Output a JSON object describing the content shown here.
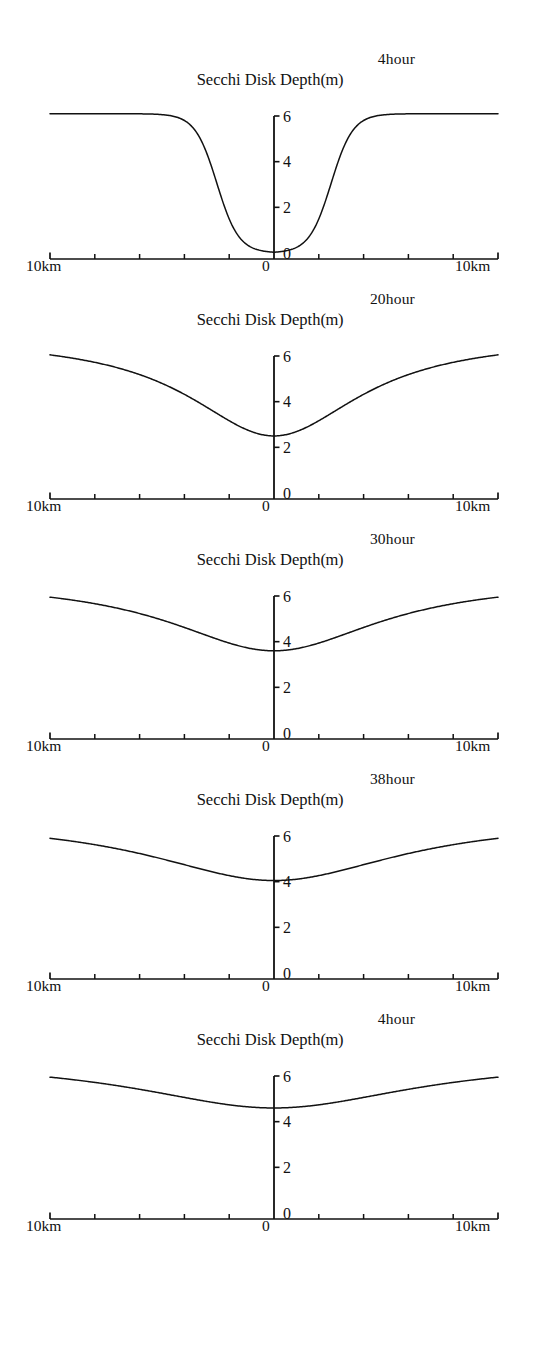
{
  "figure": {
    "axis_title": "Secchi Disk Depth",
    "axis_units": "(m)",
    "x_left_label": "10km",
    "x_center_label": "0",
    "x_right_label": "10km",
    "y_ticks": [
      "0",
      "2",
      "4",
      "6"
    ],
    "caption": ""
  },
  "chart_data": {
    "type": "line",
    "xlabel": "Distance (km)",
    "ylabel": "Secchi Disk Depth (m)",
    "xlim": [
      -10,
      10
    ],
    "ylim": [
      0,
      6.6
    ],
    "x_tick_interval_km": 2,
    "y_tick_values": [
      0,
      2,
      4,
      6
    ],
    "grid": false,
    "legend_position": "none",
    "panel_labels": [
      "4hour",
      "20hour",
      "30hour",
      "38hour",
      "4hour"
    ],
    "x": [
      -10,
      -9,
      -8,
      -7,
      -6,
      -5,
      -4,
      -3,
      -2,
      -1,
      0,
      1,
      2,
      3,
      4,
      5,
      6,
      7,
      8,
      9,
      10
    ],
    "series": [
      {
        "name": "4hour",
        "label": "4hour",
        "minimum_value": 0.0,
        "edge_value": 6.1,
        "values": [
          6.1,
          6.1,
          6.1,
          6.1,
          6.1,
          6.08,
          5.95,
          5.45,
          4.2,
          2.0,
          0.05,
          1.1,
          3.3,
          5.15,
          5.9,
          6.07,
          6.1,
          6.1,
          6.1,
          6.1,
          6.1
        ]
      },
      {
        "name": "20hour",
        "label": "20hour",
        "minimum_value": 2.5,
        "edge_value": 6.05,
        "values": [
          6.05,
          5.95,
          5.75,
          5.4,
          4.95,
          4.45,
          3.95,
          3.45,
          3.0,
          2.65,
          2.5,
          2.55,
          2.8,
          3.25,
          3.8,
          4.35,
          4.9,
          5.4,
          5.75,
          5.95,
          6.05
        ]
      },
      {
        "name": "30hour",
        "label": "30hour",
        "minimum_value": 3.6,
        "edge_value": 5.95,
        "values": [
          5.95,
          5.85,
          5.7,
          5.45,
          5.15,
          4.8,
          4.45,
          4.15,
          3.9,
          3.7,
          3.62,
          3.62,
          3.72,
          3.95,
          4.25,
          4.6,
          4.95,
          5.3,
          5.6,
          5.82,
          5.95
        ]
      },
      {
        "name": "38hour",
        "label": "38hour",
        "minimum_value": 4.05,
        "edge_value": 5.9
      },
      {
        "name": "4hour-late",
        "label": "4hour",
        "minimum_value": 4.6,
        "edge_value": 5.95
      }
    ]
  },
  "panels": [
    {
      "hour": "4hour",
      "title": "Secchi Disk Depth",
      "units": "(m)",
      "x_left": "10km",
      "x_zero": "0",
      "x_right": "10km"
    },
    {
      "hour": "20hour",
      "title": "Secchi Disk Depth",
      "units": "(m)",
      "x_left": "10km",
      "x_zero": "0",
      "x_right": "10km"
    },
    {
      "hour": "30hour",
      "title": "Secchi Disk Depth",
      "units": "(m)",
      "x_left": "10km",
      "x_zero": "0",
      "x_right": "10km"
    },
    {
      "hour": "38hour",
      "title": "Secchi Disk Depth",
      "units": "(m)",
      "x_left": "10km",
      "x_zero": "0",
      "x_right": "10km"
    },
    {
      "hour": "4hour",
      "title": "Secchi Disk Depth",
      "units": "(m)",
      "x_left": "10km",
      "x_zero": "0",
      "x_right": "10km"
    }
  ]
}
